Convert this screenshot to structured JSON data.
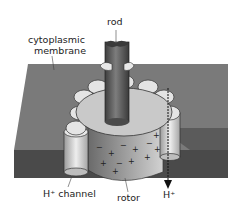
{
  "diagram": {
    "labels": {
      "rod": "rod",
      "membrane_line1": "cytoplasmic",
      "membrane_line2": "membrane",
      "channel": "H⁺ channel",
      "rotor": "rotor",
      "proton": "H⁺"
    },
    "colors": {
      "membrane_top": "#7a7a7a",
      "membrane_side": "#4a4a4a",
      "disc": "#c9c9c9",
      "rod": "#5e5e5e",
      "rotor": "#8f8f8f",
      "channel": "#dcdcdc",
      "text": "#222222"
    }
  }
}
